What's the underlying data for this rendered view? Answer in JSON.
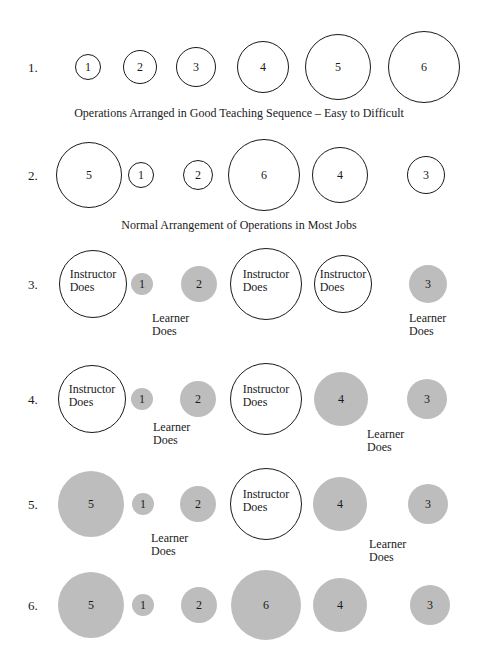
{
  "colors": {
    "ink": "#1a1a1a",
    "learner_fill": "#bdbdbd",
    "background": "#ffffff"
  },
  "rows": [
    {
      "label": "1.",
      "y": 67,
      "circles": [
        {
          "text": "1",
          "x": 88,
          "r": 13,
          "style": "outline"
        },
        {
          "text": "2",
          "x": 140,
          "r": 17,
          "style": "outline"
        },
        {
          "text": "3",
          "x": 196,
          "r": 20,
          "style": "outline"
        },
        {
          "text": "4",
          "x": 263,
          "r": 26,
          "style": "outline"
        },
        {
          "text": "5",
          "x": 338,
          "r": 33,
          "style": "outline"
        },
        {
          "text": "6",
          "x": 424,
          "r": 36,
          "style": "outline"
        }
      ],
      "caption": "Operations Arranged in Good Teaching Sequence – Easy to Difficult",
      "caption_y": 106,
      "learner_labels": []
    },
    {
      "label": "2.",
      "y": 175,
      "circles": [
        {
          "text": "5",
          "x": 89,
          "r": 33,
          "style": "outline"
        },
        {
          "text": "1",
          "x": 141,
          "r": 13,
          "style": "outline"
        },
        {
          "text": "2",
          "x": 198,
          "r": 15,
          "style": "outline"
        },
        {
          "text": "6",
          "x": 264,
          "r": 36,
          "style": "outline"
        },
        {
          "text": "4",
          "x": 340,
          "r": 28,
          "style": "outline"
        },
        {
          "text": "3",
          "x": 426,
          "r": 19,
          "style": "outline"
        }
      ],
      "caption": "Normal Arrangement of Operations in Most Jobs",
      "caption_y": 218,
      "learner_labels": []
    },
    {
      "label": "3.",
      "y": 284,
      "circles": [
        {
          "text": "Instructor\nDoes",
          "x": 93,
          "r": 34,
          "style": "outline"
        },
        {
          "text": "1",
          "x": 142,
          "r": 11,
          "style": "filled"
        },
        {
          "text": "2",
          "x": 199,
          "r": 18,
          "style": "filled"
        },
        {
          "text": "Instructor\nDoes",
          "x": 266,
          "r": 36,
          "style": "outline"
        },
        {
          "text": "Instructor\nDoes",
          "x": 343,
          "r": 29,
          "style": "outline"
        },
        {
          "text": "3",
          "x": 428,
          "r": 19,
          "style": "filled"
        }
      ],
      "caption": "",
      "learner_labels": [
        {
          "text": "Learner\nDoes",
          "x": 152,
          "y": 312
        },
        {
          "text": "Learner\nDoes",
          "x": 409,
          "y": 312
        }
      ]
    },
    {
      "label": "4.",
      "y": 399,
      "circles": [
        {
          "text": "Instructor\nDoes",
          "x": 92,
          "r": 34,
          "style": "outline"
        },
        {
          "text": "1",
          "x": 142,
          "r": 11,
          "style": "filled"
        },
        {
          "text": "2",
          "x": 198,
          "r": 18,
          "style": "filled"
        },
        {
          "text": "Instructor\nDoes",
          "x": 266,
          "r": 36,
          "style": "outline"
        },
        {
          "text": "4",
          "x": 341,
          "r": 27,
          "style": "filled"
        },
        {
          "text": "3",
          "x": 427,
          "r": 20,
          "style": "filled"
        }
      ],
      "caption": "",
      "learner_labels": [
        {
          "text": "Learner\nDoes",
          "x": 153,
          "y": 421
        },
        {
          "text": "Learner\nDoes",
          "x": 367,
          "y": 428
        }
      ]
    },
    {
      "label": "5.",
      "y": 504,
      "circles": [
        {
          "text": "5",
          "x": 91,
          "r": 33,
          "style": "filled"
        },
        {
          "text": "1",
          "x": 143,
          "r": 11,
          "style": "filled"
        },
        {
          "text": "2",
          "x": 198,
          "r": 18,
          "style": "filled"
        },
        {
          "text": "Instructor\nDoes",
          "x": 266,
          "r": 36,
          "style": "outline"
        },
        {
          "text": "4",
          "x": 340,
          "r": 27,
          "style": "filled"
        },
        {
          "text": "3",
          "x": 428,
          "r": 20,
          "style": "filled"
        }
      ],
      "caption": "",
      "learner_labels": [
        {
          "text": "Learner\nDoes",
          "x": 151,
          "y": 532
        },
        {
          "text": "Learner\nDoes",
          "x": 369,
          "y": 538
        }
      ]
    },
    {
      "label": "6.",
      "y": 605,
      "circles": [
        {
          "text": "5",
          "x": 91,
          "r": 33,
          "style": "filled"
        },
        {
          "text": "1",
          "x": 143,
          "r": 11,
          "style": "filled"
        },
        {
          "text": "2",
          "x": 199,
          "r": 18,
          "style": "filled"
        },
        {
          "text": "6",
          "x": 266,
          "r": 35,
          "style": "filled"
        },
        {
          "text": "4",
          "x": 340,
          "r": 27,
          "style": "filled"
        },
        {
          "text": "3",
          "x": 430,
          "r": 20,
          "style": "filled"
        }
      ],
      "caption": "",
      "learner_labels": []
    }
  ]
}
